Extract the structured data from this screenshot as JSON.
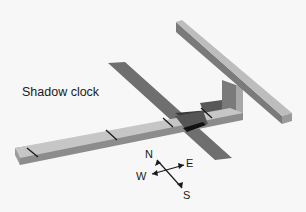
{
  "diagram": {
    "title": "Shadow clock",
    "compass": {
      "north": "N",
      "south": "S",
      "east": "E",
      "west": "W"
    },
    "hour_marks": 4,
    "colors": {
      "background": "#f7f7f7",
      "base_top": "#c4c4c4",
      "base_side": "#8c8c8c",
      "shadow": "#6f6f6f",
      "crossbar_top": "#b8b8b8",
      "crossbar_side": "#7a7a7a",
      "dark_shadow": "#2e2e2e",
      "marks": "#1a1a1a"
    }
  }
}
